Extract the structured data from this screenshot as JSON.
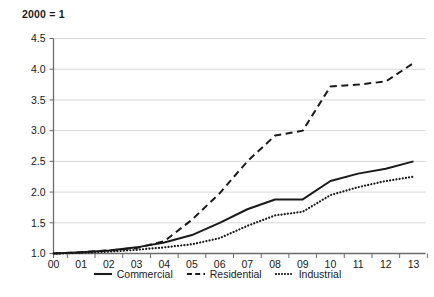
{
  "chart_data": {
    "type": "line",
    "title": "2000 = 1",
    "xlabel": "",
    "ylabel": "",
    "ylim": [
      1.0,
      4.5
    ],
    "yticks": [
      "1.0",
      "1.5",
      "2.0",
      "2.5",
      "3.0",
      "3.5",
      "4.0",
      "4.5"
    ],
    "ytick_values": [
      1.0,
      1.5,
      2.0,
      2.5,
      3.0,
      3.5,
      4.0,
      4.5
    ],
    "grid": "horizontal",
    "legend_position": "bottom-center",
    "categories": [
      "00",
      "01",
      "02",
      "03",
      "04",
      "05",
      "06",
      "07",
      "08",
      "09",
      "10",
      "11",
      "12",
      "13"
    ],
    "series": [
      {
        "name": "Commercial",
        "style": "solid",
        "color": "#1a1a1a",
        "values": [
          1.0,
          1.02,
          1.05,
          1.1,
          1.18,
          1.3,
          1.5,
          1.72,
          1.88,
          1.88,
          2.18,
          2.3,
          2.38,
          2.5
        ]
      },
      {
        "name": "Residential",
        "style": "dashed",
        "color": "#1a1a1a",
        "values": [
          1.0,
          1.02,
          1.05,
          1.09,
          1.2,
          1.55,
          1.98,
          2.5,
          2.92,
          3.0,
          3.72,
          3.75,
          3.8,
          4.1
        ]
      },
      {
        "name": "Industrial",
        "style": "dotted",
        "color": "#1a1a1a",
        "values": [
          1.0,
          1.01,
          1.03,
          1.06,
          1.1,
          1.15,
          1.25,
          1.45,
          1.62,
          1.68,
          1.95,
          2.08,
          2.18,
          2.25
        ]
      }
    ]
  },
  "legend": {
    "items": [
      {
        "label": "Commercial"
      },
      {
        "label": "Residential"
      },
      {
        "label": "Industrial"
      }
    ]
  },
  "colors": {
    "line": "#1a1a1a",
    "grid": "#d8d8d8",
    "axis": "#6b6b6b",
    "background": "#ffffff"
  }
}
